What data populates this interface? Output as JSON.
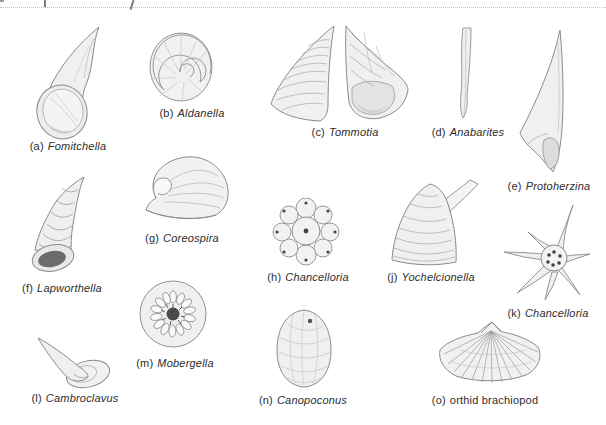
{
  "palette": {
    "paper": "#ffffff",
    "caption_ink": "#2d2d2d",
    "outline": "#8b8b8b",
    "fill_light": "#f0f0f0",
    "shade": "#dcdcdc",
    "accent_dark": "#4a4a4a"
  },
  "figures": [
    {
      "id": "a",
      "prefix": "(a)",
      "name": "Fomitchella",
      "italic": true
    },
    {
      "id": "b",
      "prefix": "(b)",
      "name": "Aldanella",
      "italic": true
    },
    {
      "id": "c",
      "prefix": "(c)",
      "name": "Tommotia",
      "italic": true
    },
    {
      "id": "d",
      "prefix": "(d)",
      "name": "Anabarites",
      "italic": true
    },
    {
      "id": "e",
      "prefix": "(e)",
      "name": "Protoherzina",
      "italic": true
    },
    {
      "id": "f",
      "prefix": "(f)",
      "name": "Lapworthella",
      "italic": true
    },
    {
      "id": "g",
      "prefix": "(g)",
      "name": "Coreospira",
      "italic": true
    },
    {
      "id": "h",
      "prefix": "(h)",
      "name": "Chancelloria",
      "italic": true
    },
    {
      "id": "j",
      "prefix": "(j)",
      "name": "Yochelcionella",
      "italic": true
    },
    {
      "id": "k",
      "prefix": "(k)",
      "name": "Chancelloria",
      "italic": true
    },
    {
      "id": "l",
      "prefix": "(l)",
      "name": "Cambroclavus",
      "italic": true
    },
    {
      "id": "m",
      "prefix": "(m)",
      "name": "Mobergella",
      "italic": true
    },
    {
      "id": "n",
      "prefix": "(n)",
      "name": "Canopoconus",
      "italic": true
    },
    {
      "id": "o",
      "prefix": "(o)",
      "name": "orthid brachiopod",
      "italic": false
    }
  ]
}
